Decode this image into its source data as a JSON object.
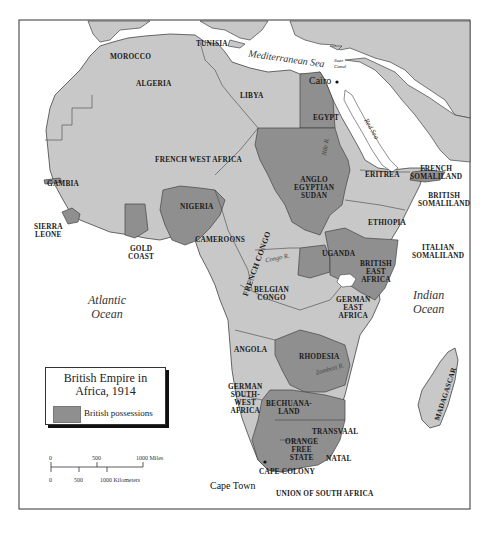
{
  "map": {
    "title": "British Empire in Africa, 1914",
    "title_line1": "British Empire in",
    "title_line2": "Africa, 1914",
    "legend": {
      "items": [
        {
          "label": "British possessions",
          "color": "#8f8f8f"
        }
      ]
    },
    "colors": {
      "british": "#8f8f8f",
      "other": "#c8c8c8",
      "water": "#ffffff",
      "border": "#444444"
    },
    "scale_bar": {
      "miles": {
        "ticks": [
          "0",
          "500",
          "1000 Miles"
        ]
      },
      "kilometers": {
        "ticks": [
          "0",
          "500",
          "1000 Kilometers"
        ]
      }
    },
    "water_bodies": [
      {
        "name": "Mediterranean Sea"
      },
      {
        "name": "Atlantic",
        "line2": "Ocean"
      },
      {
        "name": "Indian",
        "line2": "Ocean"
      },
      {
        "name": "Red Sea"
      }
    ],
    "rivers": [
      {
        "name": "Nile R."
      },
      {
        "name": "Congo R."
      },
      {
        "name": "Zambezi R."
      }
    ],
    "cities": [
      {
        "name": "Cairo"
      },
      {
        "name": "Cape Town"
      },
      {
        "name": "Suez Canal"
      }
    ],
    "regions": [
      {
        "name": "MOROCCO",
        "british": false
      },
      {
        "name": "ALGERIA",
        "british": false
      },
      {
        "name": "TUNISIA",
        "british": false
      },
      {
        "name": "LIBYA",
        "british": false
      },
      {
        "name": "EGYPT",
        "british": true
      },
      {
        "name": "FRENCH WEST AFRICA",
        "british": false
      },
      {
        "name": "GAMBIA",
        "british": true
      },
      {
        "name": "SIERRA",
        "line2": "LEONE",
        "british": true
      },
      {
        "name": "GOLD",
        "line2": "COAST",
        "british": true
      },
      {
        "name": "NIGERIA",
        "british": true
      },
      {
        "name": "CAMEROONS",
        "british": false
      },
      {
        "name": "FRENCH CONGO",
        "british": false
      },
      {
        "name": "ANGLO",
        "line2": "EGYPTIAN",
        "line3": "SUDAN",
        "british": true
      },
      {
        "name": "ERITREA",
        "british": false
      },
      {
        "name": "FRENCH",
        "line2": "SOMALILAND",
        "british": false
      },
      {
        "name": "BRITISH",
        "line2": "SOMALILAND",
        "british": true
      },
      {
        "name": "ETHIOPIA",
        "british": false
      },
      {
        "name": "ITALIAN",
        "line2": "SOMALILAND",
        "british": false
      },
      {
        "name": "UGANDA",
        "british": true
      },
      {
        "name": "BRITISH",
        "line2": "EAST",
        "line3": "AFRICA",
        "british": true
      },
      {
        "name": "BELGIAN",
        "line2": "CONGO",
        "british": false
      },
      {
        "name": "GERMAN",
        "line2": "EAST",
        "line3": "AFRICA",
        "british": false
      },
      {
        "name": "ANGOLA",
        "british": false
      },
      {
        "name": "RHODESIA",
        "british": true
      },
      {
        "name": "GERMAN",
        "line2": "SOUTH-",
        "line3": "WEST",
        "line4": "AFRICA",
        "british": false
      },
      {
        "name": "BECHUANA-",
        "line2": "LAND",
        "british": true
      },
      {
        "name": "TRANSVAAL",
        "british": true
      },
      {
        "name": "ORANGE",
        "line2": "FREE",
        "line3": "STATE",
        "british": true
      },
      {
        "name": "NATAL",
        "british": true
      },
      {
        "name": "CAPE COLONY",
        "british": true
      },
      {
        "name": "UNION OF SOUTH AFRICA",
        "british": true
      },
      {
        "name": "MADAGASCAR",
        "british": false
      }
    ]
  }
}
